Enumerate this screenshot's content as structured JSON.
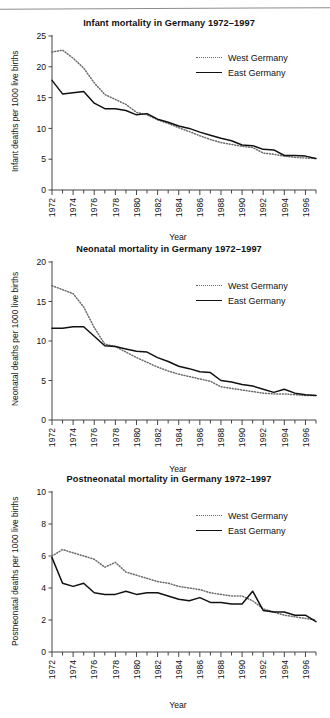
{
  "page": {
    "rule_visible": true
  },
  "legend": {
    "west_label": "West Germany",
    "east_label": "East Germany",
    "west_style": "dotted",
    "east_style": "solid",
    "west_color": "#6a6a6a",
    "east_color": "#111111"
  },
  "axis": {
    "xlabel": "Year",
    "xticks": [
      "1972",
      "1974",
      "1976",
      "1978",
      "1980",
      "1982",
      "1984",
      "1986",
      "1988",
      "1990",
      "1992",
      "1994",
      "1996"
    ]
  },
  "chart_data": [
    {
      "type": "line",
      "title": "Infant mortality in Germany 1972–1997",
      "xlabel": "Year",
      "ylabel": "Infant deaths per 1000 live births",
      "xlim": [
        1972,
        1997
      ],
      "ylim": [
        0,
        25
      ],
      "yticks": [
        0,
        5,
        10,
        15,
        20,
        25
      ],
      "xticks": [
        1972,
        1974,
        1976,
        1978,
        1980,
        1982,
        1984,
        1986,
        1988,
        1990,
        1992,
        1994,
        1996
      ],
      "grid": false,
      "legend_position": "upper right",
      "x": [
        1972,
        1973,
        1974,
        1975,
        1976,
        1977,
        1978,
        1979,
        1980,
        1981,
        1982,
        1983,
        1984,
        1985,
        1986,
        1987,
        1988,
        1989,
        1990,
        1991,
        1992,
        1993,
        1994,
        1995,
        1996,
        1997
      ],
      "series": [
        {
          "name": "West Germany",
          "style": "dotted",
          "values": [
            22.4,
            22.7,
            21.4,
            19.8,
            17.4,
            15.5,
            14.7,
            13.9,
            12.6,
            12.2,
            11.4,
            10.8,
            10.1,
            9.5,
            8.8,
            8.2,
            7.7,
            7.4,
            7.1,
            6.9,
            6.0,
            5.8,
            5.5,
            5.3,
            5.2,
            5.1
          ]
        },
        {
          "name": "East Germany",
          "style": "solid",
          "values": [
            17.8,
            15.6,
            15.8,
            16.0,
            14.1,
            13.2,
            13.2,
            12.9,
            12.2,
            12.4,
            11.5,
            11.0,
            10.4,
            10.0,
            9.4,
            8.9,
            8.4,
            8.0,
            7.3,
            7.2,
            6.6,
            6.5,
            5.6,
            5.6,
            5.5,
            5.1
          ]
        }
      ]
    },
    {
      "type": "line",
      "title": "Neonatal mortality in Germany 1972–1997",
      "xlabel": "Year",
      "ylabel": "Neonatal deaths per 1000 live births",
      "xlim": [
        1972,
        1997
      ],
      "ylim": [
        0,
        20
      ],
      "yticks": [
        0,
        5,
        10,
        15,
        20
      ],
      "xticks": [
        1972,
        1974,
        1976,
        1978,
        1980,
        1982,
        1984,
        1986,
        1988,
        1990,
        1992,
        1994,
        1996
      ],
      "grid": false,
      "legend_position": "upper right",
      "x": [
        1972,
        1973,
        1974,
        1975,
        1976,
        1977,
        1978,
        1979,
        1980,
        1981,
        1982,
        1983,
        1984,
        1985,
        1986,
        1987,
        1988,
        1989,
        1990,
        1991,
        1992,
        1993,
        1994,
        1995,
        1996,
        1997
      ],
      "series": [
        {
          "name": "West Germany",
          "style": "dotted",
          "values": [
            17.0,
            16.5,
            16.0,
            14.3,
            11.7,
            9.6,
            9.3,
            8.6,
            7.9,
            7.3,
            6.7,
            6.2,
            5.8,
            5.5,
            5.2,
            4.9,
            4.2,
            4.0,
            3.8,
            3.6,
            3.4,
            3.3,
            3.3,
            3.2,
            3.1,
            3.1
          ]
        },
        {
          "name": "East Germany",
          "style": "solid",
          "values": [
            11.6,
            11.6,
            11.8,
            11.8,
            10.6,
            9.4,
            9.3,
            9.0,
            8.7,
            8.6,
            7.9,
            7.4,
            6.8,
            6.5,
            6.1,
            6.0,
            5.0,
            4.8,
            4.5,
            4.3,
            3.9,
            3.5,
            3.9,
            3.4,
            3.2,
            3.1
          ]
        }
      ]
    },
    {
      "type": "line",
      "title": "Postneonatal mortality in Germany 1972–1997",
      "xlabel": "Year",
      "ylabel": "Postneonatal deaths per 1000 live births",
      "xlim": [
        1972,
        1997
      ],
      "ylim": [
        0,
        10
      ],
      "yticks": [
        0,
        2,
        4,
        6,
        8,
        10
      ],
      "xticks": [
        1972,
        1974,
        1976,
        1978,
        1980,
        1982,
        1984,
        1986,
        1988,
        1990,
        1992,
        1994,
        1996
      ],
      "grid": false,
      "legend_position": "upper right",
      "x": [
        1972,
        1973,
        1974,
        1975,
        1976,
        1977,
        1978,
        1979,
        1980,
        1981,
        1982,
        1983,
        1984,
        1985,
        1986,
        1987,
        1988,
        1989,
        1990,
        1991,
        1992,
        1993,
        1994,
        1995,
        1996,
        1997
      ],
      "series": [
        {
          "name": "West Germany",
          "style": "dotted",
          "values": [
            6.0,
            6.4,
            6.2,
            6.0,
            5.8,
            5.3,
            5.6,
            5.0,
            4.8,
            4.6,
            4.4,
            4.3,
            4.1,
            4.0,
            3.9,
            3.7,
            3.6,
            3.5,
            3.5,
            3.2,
            2.7,
            2.5,
            2.3,
            2.2,
            2.1,
            2.0
          ]
        },
        {
          "name": "East Germany",
          "style": "solid",
          "values": [
            5.9,
            4.3,
            4.1,
            4.3,
            3.7,
            3.6,
            3.6,
            3.8,
            3.6,
            3.7,
            3.7,
            3.5,
            3.3,
            3.2,
            3.4,
            3.1,
            3.1,
            3.0,
            3.0,
            3.8,
            2.6,
            2.5,
            2.5,
            2.3,
            2.3,
            1.9
          ]
        }
      ]
    }
  ]
}
